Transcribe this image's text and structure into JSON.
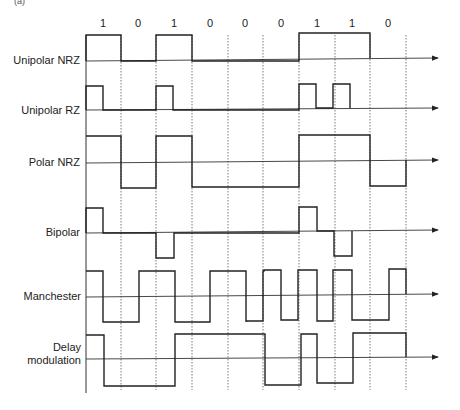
{
  "figure": {
    "corner_mark": "(a)",
    "bits": [
      "1",
      "0",
      "1",
      "0",
      "0",
      "0",
      "1",
      "1",
      "0"
    ],
    "signals": [
      {
        "id": "unipolar-nrz",
        "label": "Unipolar NRZ"
      },
      {
        "id": "unipolar-rz",
        "label": "Unipolar RZ"
      },
      {
        "id": "polar-nrz",
        "label": "Polar NRZ"
      },
      {
        "id": "bipolar",
        "label": "Bipolar"
      },
      {
        "id": "manchester",
        "label": "Manchester"
      },
      {
        "id": "delay-modulation",
        "label_line1": "Delay",
        "label_line2": "modulation"
      }
    ],
    "colors": {
      "line": "#222222",
      "grid": "#555555",
      "axis": "#333333"
    }
  }
}
